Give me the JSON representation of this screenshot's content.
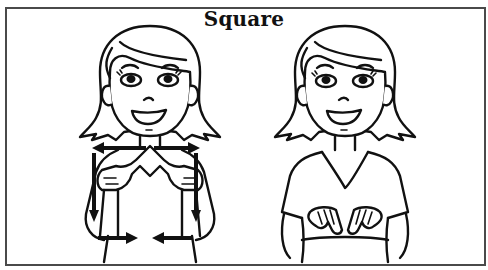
{
  "title": "Square",
  "figures": [
    {
      "id": "figure-left",
      "description": "Signer with index fingers touching at chest, arrows showing outward then downward then inward motion"
    },
    {
      "id": "figure-right",
      "description": "Signer with hands ending at bottom, fingertips touching"
    }
  ],
  "colors": {
    "line": "#111111",
    "border": "#4a4a4a",
    "background": "#ffffff"
  }
}
